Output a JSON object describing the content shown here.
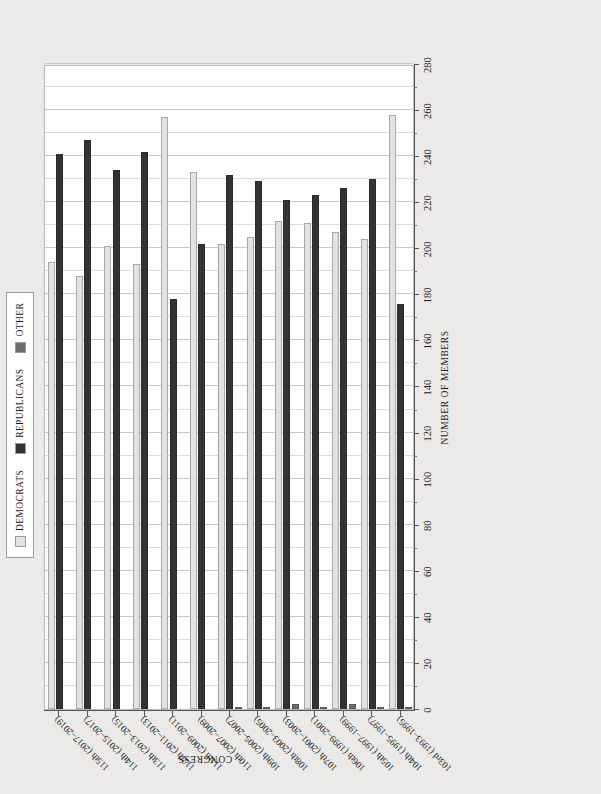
{
  "chart_data": {
    "type": "bar",
    "orientation": "horizontal",
    "title": "",
    "xlabel": "NUMBER OF MEMBERS",
    "ylabel": "CONGRESS",
    "xlim": [
      0,
      280
    ],
    "xticks": [
      0,
      20,
      40,
      60,
      80,
      100,
      120,
      140,
      160,
      180,
      200,
      220,
      240,
      260,
      280
    ],
    "grid": true,
    "legend_position": "top-left",
    "categories": [
      "103rd (1993–1995)",
      "104th (1995–1997)",
      "105th (1997–1999)",
      "106th (1999–2001)",
      "107th (2001–2003)",
      "108th (2003–2005)",
      "109th (2005–2007)",
      "110th (2007–2009)",
      "111th (2009–2011)",
      "112th (2011–2013)",
      "113th (2013–2015)",
      "114th (2015–2017)",
      "115th (2017–2019)"
    ],
    "series": [
      {
        "name": "DEMOCRATS",
        "color": "#e2e2e2",
        "values": [
          258,
          204,
          207,
          211,
          212,
          205,
          202,
          233,
          257,
          193,
          201,
          188,
          194
        ]
      },
      {
        "name": "REPUBLICANS",
        "color": "#333333",
        "values": [
          176,
          230,
          226,
          223,
          221,
          229,
          232,
          202,
          178,
          242,
          234,
          247,
          241
        ]
      },
      {
        "name": "OTHER",
        "color": "#6e6e6e",
        "values": [
          1,
          1,
          2,
          1,
          2,
          1,
          1,
          0,
          0,
          0,
          0,
          0,
          0
        ]
      }
    ]
  },
  "legend": {
    "items": [
      {
        "label": "DEMOCRATS",
        "swatch": "dem-swatch"
      },
      {
        "label": "REPUBLICANS",
        "swatch": "rep-swatch"
      },
      {
        "label": "OTHER",
        "swatch": "oth-swatch"
      }
    ]
  }
}
